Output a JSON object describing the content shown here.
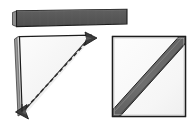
{
  "figure": {
    "background_color": "#ffffff",
    "width": 196,
    "height": 132,
    "panel_count": 3
  },
  "palette": {
    "outline": "#1c1c1c",
    "outline_soft": "#3a3a3a",
    "paper_fill": "#f2f2f2",
    "paper_fill_light": "#fbfbfb",
    "paper_edge_shadow": "#9a9a9a",
    "dark_gray": "#575757",
    "mid_gray": "#6e6e6e",
    "stripe_gray": "#6a6a6a",
    "stripe_highlight": "#8d8d8d",
    "dash_color": "#2a2a2a",
    "arrow_fill": "#3b3b3b"
  },
  "panels": [
    {
      "id": "folded-strip",
      "name": "Folded paper strip",
      "description": "Long flat dark gray rectangular strip, slightly tilted, seen edge-on",
      "fill": "#575757",
      "stroke": "#1c1c1c",
      "bounds": {
        "x": 12,
        "y": 8,
        "width": 116,
        "height": 19
      },
      "tilt_degrees": -1.5
    },
    {
      "id": "folded-triangle",
      "name": "Triangle with fold arrows",
      "description": "Right triangle of folded paper with a dashed fold line along the hypotenuse and two arrowheads showing the unfolding direction",
      "fill": "#f5f5f5",
      "stroke": "#1c1c1c",
      "bounds": {
        "x": 14,
        "y": 33,
        "width": 84,
        "height": 86
      },
      "vertices": [
        {
          "label": "top-left",
          "x": 17,
          "y": 37
        },
        {
          "label": "top-right",
          "x": 92,
          "y": 35
        },
        {
          "label": "bottom-left",
          "x": 21,
          "y": 114
        }
      ],
      "dashed_line": {
        "name": "fold-crease",
        "from": {
          "x": 26,
          "y": 109
        },
        "to": {
          "x": 88,
          "y": 41
        },
        "dash_pattern": "4 3",
        "color": "#2a2a2a"
      },
      "arrows": [
        {
          "name": "arrow-top-right",
          "direction": "up-right",
          "x": 92,
          "y": 36
        },
        {
          "name": "arrow-bottom-left",
          "direction": "down-left",
          "x": 21,
          "y": 113
        }
      ]
    },
    {
      "id": "square-with-diagonal",
      "name": "Square with diagonal band",
      "description": "Square sheet of paper with a wide dark gray diagonal stripe running from the lower-left corner to the upper-right corner",
      "fill": "#f7f7f7",
      "stroke": "#1c1c1c",
      "bounds": {
        "x": 112,
        "y": 36,
        "width": 74,
        "height": 81
      },
      "diagonal_band": {
        "name": "diagonal-stripe",
        "fill": "#6a6a6a",
        "stroke": "#232323",
        "from_corner": "bottom-left",
        "to_corner": "top-right",
        "band_width": 9
      }
    }
  ]
}
